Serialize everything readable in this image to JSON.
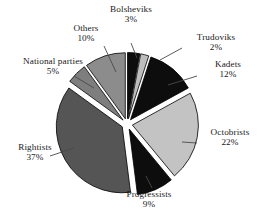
{
  "chart_data": {
    "type": "pie",
    "title": "",
    "subtitle": "",
    "xlabel": "",
    "ylabel": "",
    "legend_position": "none",
    "grid": false,
    "labels_show_percent": true,
    "exploded": true,
    "start_angle_deg": 0,
    "direction": "clockwise",
    "categories": [
      "Bolsheviks",
      "Trudoviks",
      "Kadets",
      "Octobrists",
      "Progressists",
      "Rightists",
      "National parties",
      "Others"
    ],
    "values": [
      3,
      2,
      12,
      22,
      9,
      37,
      5,
      10
    ],
    "units": "%",
    "slices": [
      {
        "name": "Bolsheviks",
        "value": 3,
        "percent_label": "3%",
        "color": "#0d0d0d",
        "edge": "#000000"
      },
      {
        "name": "Trudoviks",
        "value": 2,
        "percent_label": "2%",
        "color": "#bdbdbd",
        "edge": "#000000"
      },
      {
        "name": "Kadets",
        "value": 12,
        "percent_label": "12%",
        "color": "#0d0d0d",
        "edge": "#000000"
      },
      {
        "name": "Octobrists",
        "value": 22,
        "percent_label": "22%",
        "color": "#c3c3c3",
        "edge": "#000000"
      },
      {
        "name": "Progressists",
        "value": 9,
        "percent_label": "9%",
        "color": "#0d0d0d",
        "edge": "#000000"
      },
      {
        "name": "Rightists",
        "value": 37,
        "percent_label": "37%",
        "color": "#555555",
        "edge": "#000000"
      },
      {
        "name": "National parties",
        "value": 5,
        "percent_label": "5%",
        "color": "#7e7e7e",
        "edge": "#000000"
      },
      {
        "name": "Others",
        "value": 10,
        "percent_label": "10%",
        "color": "#8c8c8c",
        "edge": "#000000"
      }
    ]
  },
  "labels": {
    "bolsheviks": {
      "name": "Bolsheviks",
      "percent": "3%"
    },
    "trudoviks": {
      "name": "Trudoviks",
      "percent": "2%"
    },
    "kadets": {
      "name": "Kadets",
      "percent": "12%"
    },
    "octobrists": {
      "name": "Octobrists",
      "percent": "22%"
    },
    "progressists": {
      "name": "Progressists",
      "percent": "9%"
    },
    "rightists": {
      "name": "Rightists",
      "percent": "37%"
    },
    "national": {
      "name": "National parties",
      "percent": "5%"
    },
    "others": {
      "name": "Others",
      "percent": "10%"
    }
  },
  "colors": {
    "background": "#ffffff",
    "text": "#1a1a1a",
    "leader_line": "#4a4a4a",
    "slice_edge": "#000000"
  }
}
